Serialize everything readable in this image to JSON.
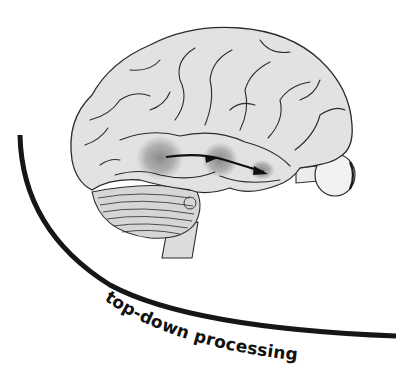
{
  "figure": {
    "label": "top-down processing",
    "colors": {
      "background": "#ffffff",
      "brain_fill": "#e2e2e2",
      "outline": "#2b2b2b",
      "highlight": "#8a8a8a",
      "curve": "#161616",
      "arrow": "#111111"
    },
    "elements": {
      "brain": "lateral-view-brain",
      "highlights": [
        "posterior-temporal-region",
        "mid-temporal-region",
        "anterior-temporal-region"
      ],
      "arrow": "posterior-to-anterior-arrow",
      "eye": "eyeball-with-optic-nerve",
      "cerebellum": "cerebellum",
      "brainstem": "brainstem",
      "curve": "top-down-curve"
    }
  }
}
